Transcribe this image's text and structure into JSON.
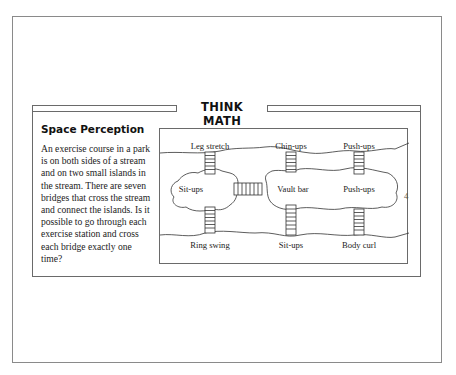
{
  "header": {
    "title": "THINK MATH"
  },
  "section": {
    "title": "Space Perception",
    "body": "An exercise course in a park is on both sides of a stream and on two small islands in the stream. There are seven bridges that cross the stream and connect the islands. Is it possible to go through each exercise station and cross each bridge exactly one time?"
  },
  "diagram": {
    "stations": {
      "top_left": "Leg stretch",
      "top_middle": "Chin-ups",
      "top_right": "Push-ups",
      "island_left": "Sit-ups",
      "island_middle": "Vault bar",
      "island_right": "Push-ups",
      "bottom_left": "Ring swing",
      "bottom_middle": "Sit-ups",
      "bottom_right": "Body curl"
    },
    "bridge_count": 7
  },
  "edge_mark": "4"
}
